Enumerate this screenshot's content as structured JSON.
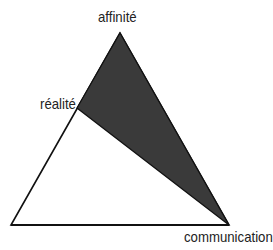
{
  "diagram": {
    "type": "ARC triangle",
    "labels": {
      "top": "affinité",
      "left": "réalité",
      "bottom_right": "communication"
    },
    "colors": {
      "shaded_region": "#3a3a3a",
      "outline": "#111111",
      "background": "#ffffff"
    }
  }
}
